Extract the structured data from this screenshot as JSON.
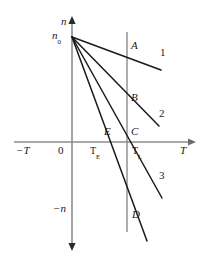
{
  "figure": {
    "type": "line-diagram",
    "background_color": "#ffffff",
    "line_color": "#1a1a1a",
    "axis_color": "#808080",
    "width": 206,
    "height": 261
  },
  "axes": {
    "vertical_label_positive": "n",
    "vertical_label_negative": "−n",
    "horizontal_label_positive": "T",
    "horizontal_label_negative": "−T",
    "origin_label": "0",
    "origin_px": {
      "x": 72,
      "y": 142
    },
    "y_axis_top_px": 18,
    "y_axis_bottom_px": 248,
    "x_axis_left_px": 14,
    "x_axis_right_px": 194
  },
  "intercept": {
    "label": "n",
    "subscript": "0",
    "px": {
      "x": 72,
      "y": 37
    }
  },
  "vertical_marker": {
    "name": "T_L",
    "label": "T",
    "subscript": "L",
    "x_px": 127,
    "y_top_px": 32,
    "y_bottom_px": 232,
    "tick_label": "T",
    "tick_subscript": "L"
  },
  "temperature_ticks": [
    {
      "label": "T",
      "subscript": "E",
      "x_px": 96
    },
    {
      "label": "T",
      "subscript": "L",
      "x_px": 134
    }
  ],
  "lines": [
    {
      "id": "line-1",
      "number_label": "1",
      "point_label": "A",
      "start_px": {
        "x": 72,
        "y": 37
      },
      "end_px": {
        "x": 161,
        "y": 70
      },
      "point_label_px": {
        "x": 118,
        "y": 42
      },
      "number_label_px": {
        "x": 158,
        "y": 49
      }
    },
    {
      "id": "line-2",
      "number_label": "2",
      "point_label": "B",
      "start_px": {
        "x": 72,
        "y": 37
      },
      "end_px": {
        "x": 159,
        "y": 126
      },
      "point_label_px": {
        "x": 131,
        "y": 94
      },
      "number_label_px": {
        "x": 156,
        "y": 110
      }
    },
    {
      "id": "line-3",
      "number_label": "3",
      "point_label": "C",
      "start_px": {
        "x": 72,
        "y": 37
      },
      "end_px": {
        "x": 162,
        "y": 198
      },
      "point_label_px": {
        "x": 130,
        "y": 130
      },
      "number_label_px": {
        "x": 157,
        "y": 174
      }
    },
    {
      "id": "line-4",
      "number_label": "",
      "point_label": "D",
      "start_px": {
        "x": 72,
        "y": 37
      },
      "end_px": {
        "x": 147,
        "y": 241
      },
      "point_label_px": {
        "x": 131,
        "y": 211
      },
      "number_label_px": null
    }
  ],
  "axis_intersections": [
    {
      "label": "E",
      "px": {
        "x": 107,
        "y": 130
      }
    },
    {
      "label": "C",
      "px": {
        "x": 130,
        "y": 130
      }
    }
  ],
  "labels": {
    "A": "A",
    "B": "B",
    "C": "C",
    "D": "D",
    "E": "E",
    "one": "1",
    "two": "2",
    "three": "3"
  }
}
